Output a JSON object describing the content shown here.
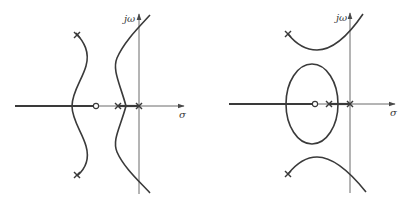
{
  "figures": [
    {
      "id": "left",
      "imag_axis_label": "jω",
      "real_axis_label": "σ",
      "description": "Root locus with complex poles; branches bend and cross imaginary axis"
    },
    {
      "id": "right",
      "imag_axis_label": "jω",
      "real_axis_label": "σ",
      "description": "Root locus with closed elliptical branch around zero and hyperbola-like branches"
    }
  ],
  "legend": {
    "pole_symbol": "×",
    "zero_symbol": "○"
  }
}
